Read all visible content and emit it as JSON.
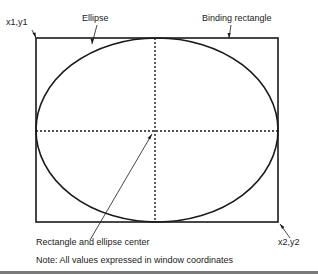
{
  "labels": {
    "top_left_corner": "x1,y1",
    "ellipse": "Ellipse",
    "binding_rectangle": "Binding rectangle",
    "center": "Rectangle and ellipse center",
    "bottom_right_corner": "x2,y2",
    "note": "Note: All values expressed in window coordinates"
  },
  "colors": {
    "stroke": "#1a1a1a",
    "text": "#222222",
    "bottom_bar": "#7a7a7a"
  }
}
